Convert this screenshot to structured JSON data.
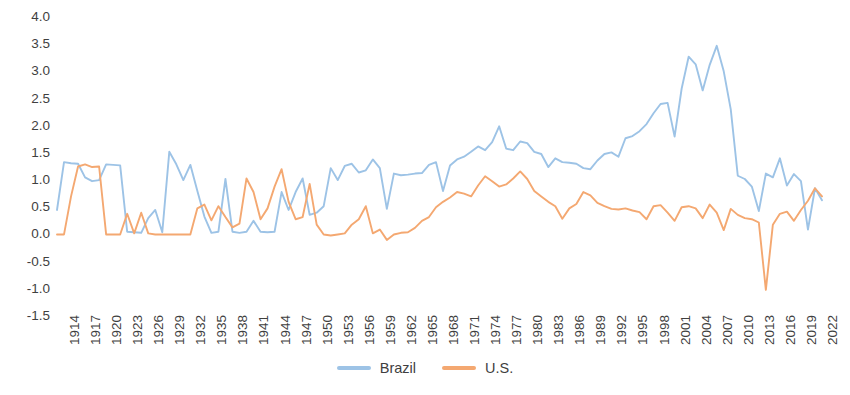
{
  "chart_data": {
    "type": "line",
    "title": "",
    "subtitle": "",
    "xlabel": "",
    "ylabel": "",
    "xlim": [
      1914,
      2023
    ],
    "ylim": [
      -1.5,
      4.0
    ],
    "y_ticks": [
      "4.0",
      "3.5",
      "3.0",
      "2.5",
      "2.0",
      "1.5",
      "1.0",
      "0.5",
      "0.0",
      "-0.5",
      "-1.0",
      "-1.5"
    ],
    "y_tick_values": [
      4.0,
      3.5,
      3.0,
      2.5,
      2.0,
      1.5,
      1.0,
      0.5,
      0.0,
      -0.5,
      -1.0,
      -1.5
    ],
    "y_tick_step": 0.5,
    "x_ticks": [
      "1914",
      "1917",
      "1920",
      "1923",
      "1926",
      "1929",
      "1932",
      "1935",
      "1938",
      "1941",
      "1944",
      "1947",
      "1950",
      "1953",
      "1956",
      "1959",
      "1962",
      "1965",
      "1968",
      "1971",
      "1974",
      "1977",
      "1980",
      "1983",
      "1986",
      "1989",
      "1992",
      "1995",
      "1998",
      "2001",
      "2004",
      "2007",
      "2010",
      "2013",
      "2016",
      "2019",
      "2022"
    ],
    "x_tick_step": 3,
    "grid": false,
    "legend_position": "bottom",
    "x": [
      1914,
      1915,
      1916,
      1917,
      1918,
      1919,
      1920,
      1921,
      1922,
      1923,
      1924,
      1925,
      1926,
      1927,
      1928,
      1929,
      1930,
      1931,
      1932,
      1933,
      1934,
      1935,
      1936,
      1937,
      1938,
      1939,
      1940,
      1941,
      1942,
      1943,
      1944,
      1945,
      1946,
      1947,
      1948,
      1949,
      1950,
      1951,
      1952,
      1953,
      1954,
      1955,
      1956,
      1957,
      1958,
      1959,
      1960,
      1961,
      1962,
      1963,
      1964,
      1965,
      1966,
      1967,
      1968,
      1969,
      1970,
      1971,
      1972,
      1973,
      1974,
      1975,
      1976,
      1977,
      1978,
      1979,
      1980,
      1981,
      1982,
      1983,
      1984,
      1985,
      1986,
      1987,
      1988,
      1989,
      1990,
      1991,
      1992,
      1993,
      1994,
      1995,
      1996,
      1997,
      1998,
      1999,
      2000,
      2001,
      2002,
      2003,
      2004,
      2005,
      2006,
      2007,
      2008,
      2009,
      2010,
      2011,
      2012,
      2013,
      2014,
      2015,
      2016,
      2017,
      2018,
      2019,
      2020,
      2021,
      2022,
      2023
    ],
    "series": [
      {
        "name": "Brazil",
        "color": "#9DC3E6",
        "values": [
          0.45,
          1.33,
          1.31,
          1.3,
          1.05,
          0.98,
          1.0,
          1.29,
          1.28,
          1.27,
          0.05,
          0.04,
          0.03,
          0.3,
          0.45,
          0.04,
          1.52,
          1.29,
          1.0,
          1.28,
          0.8,
          0.33,
          0.03,
          0.05,
          1.02,
          0.05,
          0.03,
          0.05,
          0.25,
          0.05,
          0.04,
          0.05,
          0.78,
          0.45,
          0.78,
          1.03,
          0.36,
          0.4,
          0.52,
          1.22,
          1.0,
          1.26,
          1.3,
          1.14,
          1.18,
          1.38,
          1.22,
          0.47,
          1.12,
          1.09,
          1.1,
          1.12,
          1.13,
          1.28,
          1.33,
          0.8,
          1.27,
          1.38,
          1.43,
          1.52,
          1.62,
          1.55,
          1.7,
          1.99,
          1.58,
          1.55,
          1.71,
          1.68,
          1.52,
          1.48,
          1.24,
          1.4,
          1.33,
          1.32,
          1.3,
          1.22,
          1.2,
          1.36,
          1.48,
          1.51,
          1.43,
          1.77,
          1.81,
          1.9,
          2.03,
          2.23,
          2.4,
          2.42,
          1.8,
          2.68,
          3.27,
          3.13,
          2.65,
          3.12,
          3.47,
          3.0,
          2.3,
          1.08,
          1.02,
          0.88,
          0.43,
          1.12,
          1.05,
          1.4,
          0.9,
          1.11,
          0.98,
          0.09,
          0.85,
          0.63
        ]
      },
      {
        "name": "U.S.",
        "color": "#F4A871",
        "values": [
          0.0,
          0.0,
          0.7,
          1.25,
          1.29,
          1.24,
          1.25,
          0.0,
          0.0,
          0.0,
          0.38,
          0.02,
          0.4,
          0.02,
          0.0,
          0.0,
          0.0,
          0.0,
          0.0,
          0.0,
          0.48,
          0.55,
          0.26,
          0.52,
          0.32,
          0.13,
          0.2,
          1.03,
          0.78,
          0.28,
          0.48,
          0.88,
          1.2,
          0.6,
          0.28,
          0.32,
          0.93,
          0.18,
          0.0,
          -0.02,
          0.0,
          0.02,
          0.18,
          0.28,
          0.52,
          0.02,
          0.09,
          -0.1,
          0.0,
          0.03,
          0.04,
          0.12,
          0.25,
          0.32,
          0.5,
          0.6,
          0.68,
          0.78,
          0.75,
          0.7,
          0.9,
          1.07,
          0.98,
          0.88,
          0.92,
          1.03,
          1.16,
          1.02,
          0.8,
          0.7,
          0.6,
          0.52,
          0.29,
          0.48,
          0.56,
          0.78,
          0.72,
          0.58,
          0.52,
          0.47,
          0.46,
          0.48,
          0.44,
          0.41,
          0.28,
          0.52,
          0.54,
          0.4,
          0.25,
          0.5,
          0.52,
          0.48,
          0.3,
          0.55,
          0.4,
          0.08,
          0.47,
          0.36,
          0.3,
          0.28,
          0.22,
          -1.02,
          0.18,
          0.38,
          0.42,
          0.25,
          0.45,
          0.62,
          0.85,
          0.7
        ]
      }
    ]
  },
  "legend": {
    "items": [
      {
        "label": "Brazil",
        "color": "#9DC3E6"
      },
      {
        "label": "U.S.",
        "color": "#F4A871"
      }
    ]
  }
}
